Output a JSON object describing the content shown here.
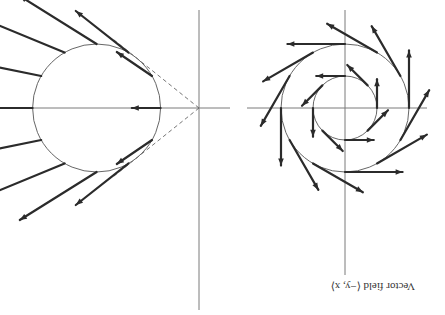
{
  "figure": {
    "orientation": "rotated 180 degrees",
    "panels": [
      {
        "id": "rotational",
        "caption": "Vector field ⟨−y, x⟩",
        "field": "rotational",
        "samples": [
          {
            "radius": 1,
            "angles_deg": [
              0,
              45,
              90,
              135,
              180,
              225,
              270,
              315
            ]
          },
          {
            "radius": 2,
            "angles_deg": [
              0,
              30,
              60,
              90,
              120,
              150,
              180,
              210,
              240,
              270,
              300,
              330
            ]
          }
        ],
        "circles": [
          1,
          2
        ]
      },
      {
        "id": "radial",
        "caption": "",
        "field": "radial-from-point",
        "circle": {
          "center": [
            -1.6,
            0
          ],
          "radius": 1
        },
        "samples": {
          "radius": 1,
          "angles_deg": [
            0,
            30,
            60,
            90,
            120,
            150,
            180,
            210,
            240,
            270,
            300,
            330
          ]
        },
        "tangent_lines_from_origin": true
      }
    ]
  }
}
